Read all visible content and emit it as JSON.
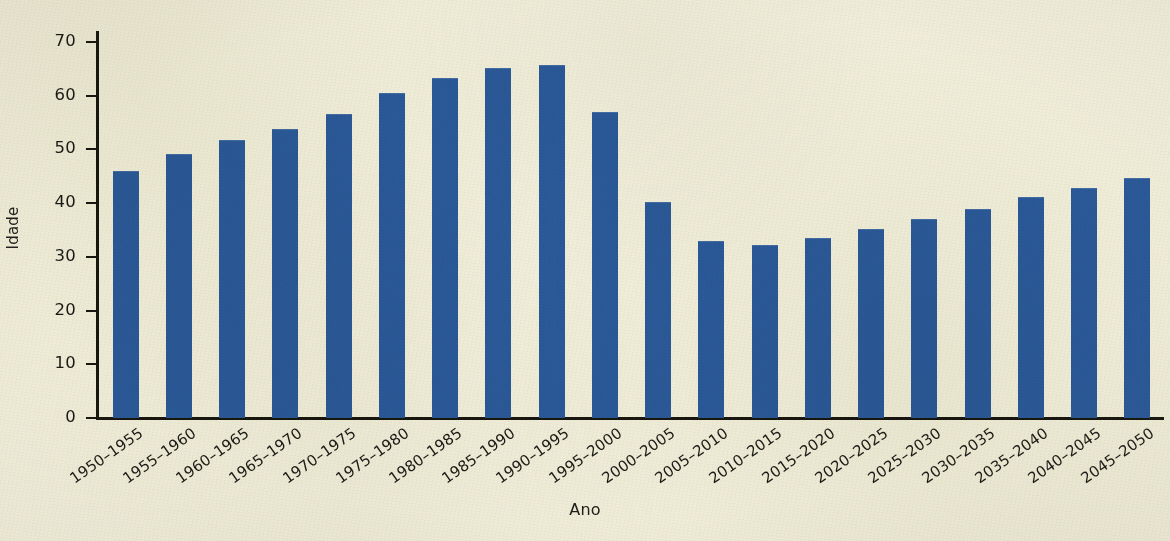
{
  "chart_data": {
    "type": "bar",
    "title": "",
    "xlabel": "Ano",
    "ylabel": "Idade",
    "categories": [
      "1950–1955",
      "1955–1960",
      "1960–1965",
      "1965–1970",
      "1970–1975",
      "1975–1980",
      "1980–1985",
      "1985–1990",
      "1990–1995",
      "1995–2000",
      "2000–2005",
      "2005–2010",
      "2010–2015",
      "2015–2020",
      "2020–2025",
      "2025–2030",
      "2030–2035",
      "2035–2040",
      "2040–2045",
      "2045–2050"
    ],
    "values": [
      46.0,
      49.2,
      51.7,
      53.7,
      56.6,
      60.4,
      63.3,
      65.2,
      65.6,
      56.9,
      40.2,
      32.9,
      32.1,
      33.5,
      35.2,
      37.0,
      38.9,
      41.2,
      42.8,
      44.7
    ],
    "ylim": [
      0,
      72
    ],
    "yticks": [
      0,
      10,
      20,
      30,
      40,
      50,
      60,
      70
    ],
    "ytick_labels": [
      "0",
      "10",
      "20",
      "30",
      "40",
      "50",
      "60",
      "70"
    ],
    "grid": false,
    "legend": "none",
    "bar_color": "#2b5a9b",
    "background_color": "#f2f0dc",
    "axis_color": "#17170f",
    "text_color": "#1b1b16",
    "xtick_rotation": -35
  }
}
